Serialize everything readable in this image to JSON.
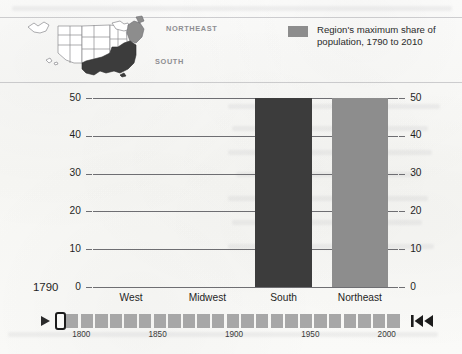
{
  "map": {
    "label_northeast": "NORTHEAST",
    "label_south": "SOUTH",
    "region_fill_south": "#3c3c3c",
    "region_fill_northeast": "#8d8d8d",
    "outline_color": "#8a8a8e"
  },
  "legend": {
    "swatch_color": "#8d8d8d",
    "text": "Region's maximum share of population, 1790 to 2010"
  },
  "chart_data": {
    "type": "bar",
    "title": "",
    "xlabel": "",
    "ylabel": "",
    "categories": [
      "West",
      "Midwest",
      "South",
      "Northeast"
    ],
    "values": [
      0,
      0,
      50,
      50
    ],
    "bar_colors": [
      "#3c3c3c",
      "#3c3c3c",
      "#3c3c3c",
      "#8d8d8d"
    ],
    "ylim": [
      0,
      50
    ],
    "yticks": [
      0,
      10,
      20,
      30,
      40,
      50
    ],
    "ytick_labels_left": [
      "0",
      "10",
      "20",
      "30",
      "40",
      "50"
    ],
    "ytick_labels_right": [
      "0",
      "10",
      "20",
      "30",
      "40",
      "50"
    ],
    "grid": true,
    "legend_position": "top-right",
    "current_year": "1790",
    "annotation": "Bars show each region's share of US population; West and Midwest are 0 in 1790."
  },
  "timeline": {
    "play_label": "play",
    "rewind_label": "skip-to-start",
    "handle_position_year": "1790",
    "range_start": 1790,
    "range_end": 2010,
    "tick_labels": [
      "1800",
      "1850",
      "1900",
      "1950",
      "2000"
    ],
    "segment_count": 23
  }
}
